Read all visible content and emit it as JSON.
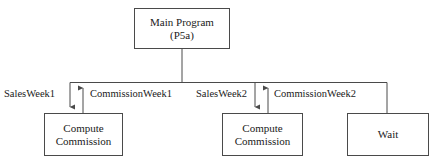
{
  "diagram": {
    "stroke_color": "#4a4a4a",
    "text_color": "#1a1a1a",
    "background_color": "#ffffff",
    "nodes": [
      {
        "id": "main",
        "line1": "Main Program",
        "line2": "(P5a)"
      },
      {
        "id": "compute1",
        "line1": "Compute",
        "line2": "Commission"
      },
      {
        "id": "compute2",
        "line1": "Compute",
        "line2": "Commission"
      },
      {
        "id": "wait",
        "line1": "Wait",
        "line2": ""
      }
    ],
    "edge_labels": {
      "sales_week_1": "SalesWeek1",
      "commission_week_1": "CommissionWeek1",
      "sales_week_2": "SalesWeek2",
      "commission_week_2": "CommissionWeek2"
    },
    "arrows": [
      {
        "name": "sales-week-1-arrow",
        "direction": "down",
        "from": "main",
        "to": "compute1"
      },
      {
        "name": "commission-week-1-arrow",
        "direction": "up",
        "from": "compute1",
        "to": "main"
      },
      {
        "name": "sales-week-2-arrow",
        "direction": "down",
        "from": "main",
        "to": "compute2"
      },
      {
        "name": "commission-week-2-arrow",
        "direction": "up",
        "from": "compute2",
        "to": "main"
      },
      {
        "name": "wait-connector",
        "direction": "none",
        "from": "main",
        "to": "wait"
      }
    ]
  }
}
